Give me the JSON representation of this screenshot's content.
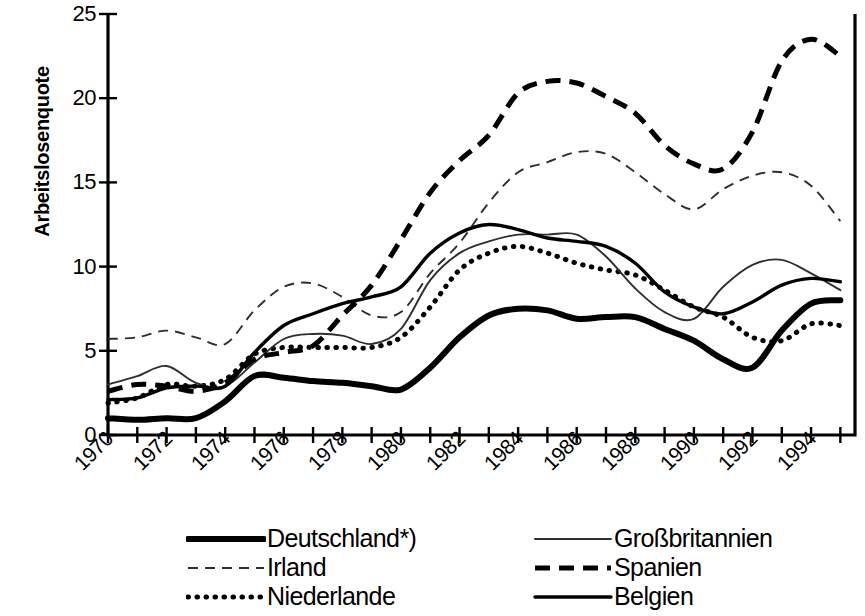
{
  "chart_data": {
    "type": "line",
    "title": "",
    "xlabel": "",
    "ylabel": "Arbeitslosenquote",
    "xlim": [
      1970,
      1995.5
    ],
    "ylim": [
      0,
      25
    ],
    "grid": false,
    "legend_position": "bottom",
    "y_ticks": [
      0,
      5,
      10,
      15,
      20,
      25
    ],
    "y_tick_labels": [
      "0",
      "5",
      "10",
      "15",
      "20",
      "25"
    ],
    "x_tick_labels": [
      "1970",
      "1972",
      "1974",
      "1976",
      "1978",
      "1980",
      "1982",
      "1984",
      "1986",
      "1988",
      "1990",
      "1992",
      "1994"
    ],
    "x_tick_values": [
      1970,
      1972,
      1974,
      1976,
      1978,
      1980,
      1982,
      1984,
      1986,
      1988,
      1990,
      1992,
      1994
    ],
    "x_minor_ticks": [
      1970,
      1971,
      1972,
      1973,
      1974,
      1975,
      1976,
      1977,
      1978,
      1979,
      1980,
      1981,
      1982,
      1983,
      1984,
      1985,
      1986,
      1987,
      1988,
      1989,
      1990,
      1991,
      1992,
      1993,
      1994,
      1995
    ],
    "x": [
      1970,
      1971,
      1972,
      1973,
      1974,
      1975,
      1976,
      1977,
      1978,
      1979,
      1980,
      1981,
      1982,
      1983,
      1984,
      1985,
      1986,
      1987,
      1988,
      1989,
      1990,
      1991,
      1992,
      1993,
      1994,
      1995
    ],
    "series": [
      {
        "name": "Deutschland*)",
        "style": "solid",
        "width": 6,
        "color": "#000000",
        "values": [
          1.0,
          0.9,
          1.0,
          1.0,
          2.0,
          3.5,
          3.4,
          3.2,
          3.1,
          2.9,
          2.7,
          4.0,
          5.8,
          7.1,
          7.5,
          7.4,
          6.9,
          7.0,
          7.0,
          6.3,
          5.6,
          4.5,
          4.0,
          6.2,
          7.8,
          8.0
        ]
      },
      {
        "name": "Irland",
        "style": "dashed-thin",
        "width": 2,
        "color": "#000000",
        "values": [
          5.7,
          5.8,
          6.2,
          5.8,
          5.4,
          7.4,
          8.8,
          9.0,
          8.2,
          7.1,
          7.3,
          9.6,
          11.4,
          13.8,
          15.6,
          16.2,
          16.8,
          16.7,
          15.6,
          14.3,
          13.4,
          14.6,
          15.4,
          15.6,
          14.8,
          12.7
        ]
      },
      {
        "name": "Niederlande",
        "style": "dotted",
        "width": 5,
        "color": "#000000",
        "values": [
          1.9,
          2.2,
          3.0,
          2.9,
          3.3,
          4.8,
          5.2,
          5.2,
          5.2,
          5.2,
          5.8,
          7.6,
          9.8,
          10.8,
          11.2,
          10.8,
          10.2,
          9.8,
          9.5,
          8.6,
          7.6,
          7.0,
          5.8,
          5.6,
          6.6,
          6.5
        ]
      },
      {
        "name": "Großbritannien",
        "style": "solid-thin",
        "width": 2,
        "color": "#000000",
        "values": [
          3.0,
          3.5,
          4.1,
          3.1,
          2.9,
          4.3,
          5.7,
          6.0,
          5.9,
          5.4,
          6.3,
          9.2,
          10.8,
          11.5,
          11.9,
          11.9,
          11.9,
          10.6,
          8.7,
          7.3,
          6.9,
          8.8,
          10.1,
          10.4,
          9.6,
          8.6
        ]
      },
      {
        "name": "Spanien",
        "style": "dashed-bold",
        "width": 5,
        "color": "#000000",
        "values": [
          2.6,
          3.0,
          2.9,
          2.6,
          3.1,
          4.5,
          4.9,
          5.3,
          7.1,
          8.9,
          11.6,
          14.4,
          16.3,
          17.8,
          20.3,
          21.0,
          20.9,
          20.1,
          19.1,
          17.2,
          16.1,
          15.8,
          18.0,
          22.2,
          23.5,
          22.5
        ]
      },
      {
        "name": "Belgien",
        "style": "solid-med",
        "width": 3.4,
        "color": "#000000",
        "values": [
          2.1,
          2.2,
          2.8,
          2.9,
          2.9,
          4.9,
          6.5,
          7.2,
          7.8,
          8.2,
          8.8,
          10.8,
          12.0,
          12.5,
          12.2,
          11.7,
          11.5,
          11.2,
          10.2,
          8.5,
          7.6,
          7.2,
          7.9,
          8.9,
          9.3,
          9.1
        ]
      }
    ]
  },
  "axis": {
    "y_title": "Arbeitslosenquote"
  },
  "legend": {
    "left_column": [
      {
        "label": "Deutschland*)",
        "style": "solid-bold"
      },
      {
        "label": "Irland",
        "style": "dashed-thin"
      },
      {
        "label": "Niederlande",
        "style": "dotted"
      }
    ],
    "right_column": [
      {
        "label": "Großbritannien",
        "style": "solid-thin"
      },
      {
        "label": "Spanien",
        "style": "dashed-bold"
      },
      {
        "label": "Belgien",
        "style": "solid-med"
      }
    ]
  },
  "colors": {
    "background": "#ffffff",
    "ink": "#000000",
    "thin_ink": "#3a3a3a"
  }
}
